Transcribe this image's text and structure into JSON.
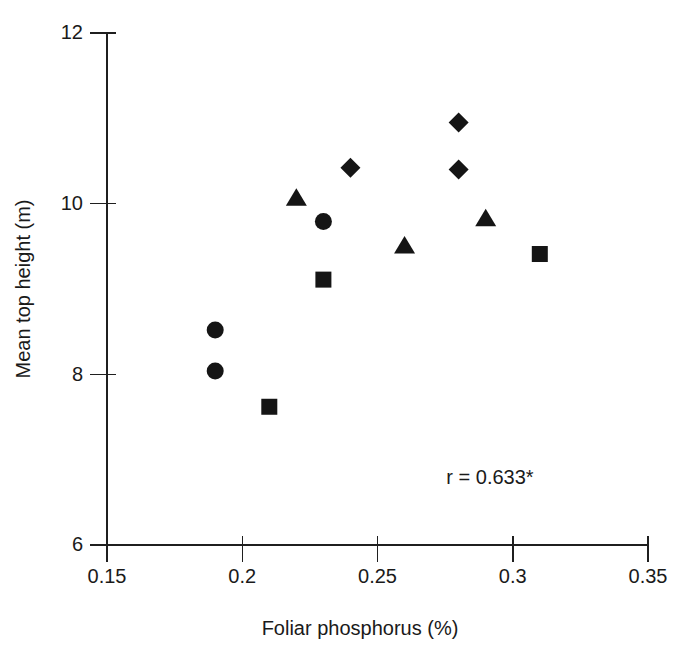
{
  "chart_data": {
    "type": "scatter",
    "title": "",
    "xlabel": "Foliar phosphorus (%)",
    "ylabel": "Mean top height (m)",
    "xlim": [
      0.15,
      0.35
    ],
    "ylim": [
      6,
      12
    ],
    "xticks": [
      0.15,
      0.2,
      0.25,
      0.3,
      0.35
    ],
    "xticklabels": [
      "0.15",
      "0.2",
      "0.25",
      "0.3",
      "0.35"
    ],
    "yticks": [
      6,
      8,
      10,
      12
    ],
    "yticklabels": [
      "6",
      "8",
      "10",
      "12"
    ],
    "grid": false,
    "legend": "none",
    "annotations": [
      {
        "text": "r = 0.633*",
        "x": 0.2925,
        "y": 7.87
      }
    ],
    "series": [
      {
        "name": "circle-series",
        "marker": "circle",
        "color": "#151515",
        "points": [
          {
            "x": 0.19,
            "y": 8.52
          },
          {
            "x": 0.19,
            "y": 8.04
          },
          {
            "x": 0.23,
            "y": 9.79
          }
        ]
      },
      {
        "name": "square-series",
        "marker": "square",
        "color": "#151515",
        "points": [
          {
            "x": 0.21,
            "y": 7.62
          },
          {
            "x": 0.23,
            "y": 9.11
          },
          {
            "x": 0.31,
            "y": 9.41
          }
        ]
      },
      {
        "name": "triangle-series",
        "marker": "triangle",
        "color": "#151515",
        "points": [
          {
            "x": 0.22,
            "y": 10.07
          },
          {
            "x": 0.26,
            "y": 9.51
          },
          {
            "x": 0.29,
            "y": 9.83
          }
        ]
      },
      {
        "name": "diamond-series",
        "marker": "diamond",
        "color": "#151515",
        "points": [
          {
            "x": 0.24,
            "y": 10.42
          },
          {
            "x": 0.28,
            "y": 10.95
          },
          {
            "x": 0.28,
            "y": 10.4
          }
        ]
      }
    ]
  }
}
